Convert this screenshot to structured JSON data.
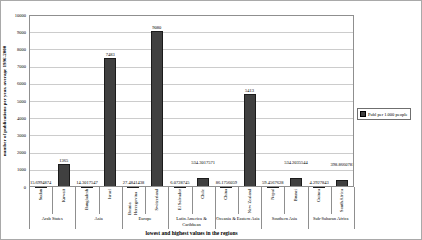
{
  "chart_data": {
    "type": "bar",
    "title": "",
    "xlabel": "lowest and highest values in the regions",
    "ylabel": "number of publications per year, average 1996-2000",
    "ylim": [
      0,
      10000
    ],
    "y_ticks": [
      0,
      1000,
      2000,
      3000,
      4000,
      5000,
      6000,
      7000,
      8000,
      9000,
      10000
    ],
    "grid": true,
    "legend": {
      "position": "right",
      "label": "Publ per 1.000 people"
    },
    "bar_color": "#404040",
    "grid_color": "#cccccc",
    "categories": [
      "Sudan",
      "Kuwait",
      "Bangladesh",
      "Israel",
      "Bosnia Herzegovina",
      "Switzerland",
      "El Salvador",
      "Chile",
      "China",
      "New Zealand",
      "Nepal",
      "Brunei",
      "Guinea",
      "South Africa"
    ],
    "values": [
      15.6994874,
      1365,
      14.3017547,
      7483,
      27.4841438,
      9080,
      6.0728745,
      534.3017571,
      86.1756059,
      5413,
      59.4567628,
      534.2035544,
      4.2927843,
      398.8660781
    ],
    "value_labels": [
      "15.6994874",
      "1365",
      "14.3017547",
      "7483",
      "27.4841438",
      "9080",
      "6.0728745",
      "534.3017571",
      "86.1756059",
      "5413",
      "59.4567628",
      "534.2035544",
      "4.2927843",
      "398.8660781"
    ],
    "label_raise": [
      0,
      0,
      0,
      0,
      0,
      0,
      0,
      12,
      0,
      0,
      0,
      12,
      0,
      12
    ],
    "groups": [
      {
        "label": "Arab States",
        "span": 2
      },
      {
        "label": "Asia",
        "span": 2
      },
      {
        "label": "Europe",
        "span": 2
      },
      {
        "label": "Latin America & Caribbean",
        "span": 2
      },
      {
        "label": "Oceania & Eastern Asia",
        "span": 2
      },
      {
        "label": "Southern Asia",
        "span": 2
      },
      {
        "label": "Sub-Saharan Africa",
        "span": 2
      }
    ]
  }
}
